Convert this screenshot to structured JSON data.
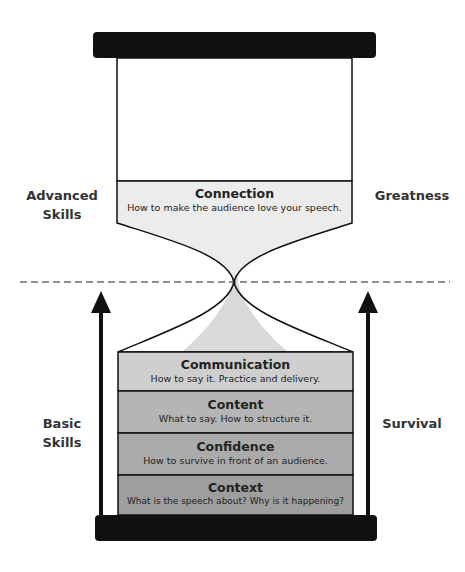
{
  "diagram": {
    "type": "hourglass",
    "divider": "dashed",
    "top_section": {
      "left_label": [
        "Advanced",
        "Skills"
      ],
      "right_label": "Greatness",
      "layers": [
        {
          "title": "Connection",
          "description": "How to make the audience love your speech.",
          "fill": "#ececec"
        }
      ]
    },
    "bottom_section": {
      "left_label": [
        "Basic",
        "Skills"
      ],
      "right_label": "Survival",
      "layers": [
        {
          "title": "Communication",
          "description": "How to say it. Practice and delivery.",
          "fill": "#cfcfcf"
        },
        {
          "title": "Content",
          "description": "What to say. How to structure it.",
          "fill": "#b5b5b5"
        },
        {
          "title": "Confidence",
          "description": "How to survive in front of an audience.",
          "fill": "#ababab"
        },
        {
          "title": "Context",
          "description": "What is the speech about? Why is it happening?",
          "fill": "#9e9e9e"
        }
      ]
    },
    "colors": {
      "frame": "#111111",
      "sand_stream": "#d9d9d9",
      "label_text": "#333333"
    }
  }
}
